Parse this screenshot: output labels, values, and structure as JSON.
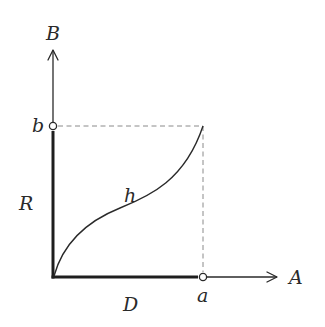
{
  "diagram": {
    "axes": {
      "x_label": "A",
      "y_label": "B"
    },
    "points": {
      "x_point_label": "a",
      "y_point_label": "b"
    },
    "segments": {
      "domain_label": "D",
      "range_label": "R"
    },
    "curve": {
      "label": "h"
    },
    "colors": {
      "stroke": "#2a2a2a",
      "dashed": "#8a8a8a",
      "background": "#ffffff"
    }
  }
}
